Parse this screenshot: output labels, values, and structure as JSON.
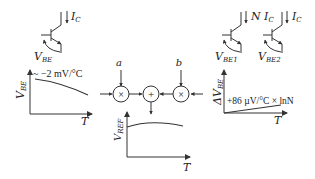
{
  "transistor_left": {
    "current_label": "I",
    "current_sub": "C",
    "vbe_label": "V",
    "vbe_sub": "BE"
  },
  "transistor_pair": {
    "t1_current_prefix": "N I",
    "t1_current_sub": "C",
    "t1_vbe_label": "V",
    "t1_vbe_sub": "BE1",
    "t2_current_label": "I",
    "t2_current_sub": "C",
    "t2_vbe_label": "V",
    "t2_vbe_sub": "BE2"
  },
  "plot_vbe": {
    "ylabel": "V",
    "ylabel_sub": "BE",
    "xlabel": "T",
    "annotation": "~ −2 mV/°C"
  },
  "plot_dvbe": {
    "ylabel": "ΔV",
    "ylabel_sub": "BE",
    "xlabel": "T",
    "annotation": "+86 µV/°C × lnN"
  },
  "plot_vref": {
    "ylabel": "V",
    "ylabel_sub": "REF",
    "xlabel": "T"
  },
  "block_diagram": {
    "input_a": "a",
    "input_b": "b",
    "multiplier_symbol": "×",
    "adder_symbol": "+"
  }
}
